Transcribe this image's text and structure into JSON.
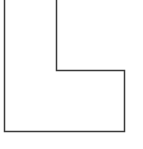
{
  "diagram": {
    "type": "outline-shape",
    "shape": "L-shape",
    "stroke_color": "#3a3a3a",
    "fill_color": "#ffffff",
    "background": "#ffffff",
    "points": "4.5,0 4.5,131.5 124.5,131.5 124.5,70.5 56.5,70.5 56.5,0"
  }
}
